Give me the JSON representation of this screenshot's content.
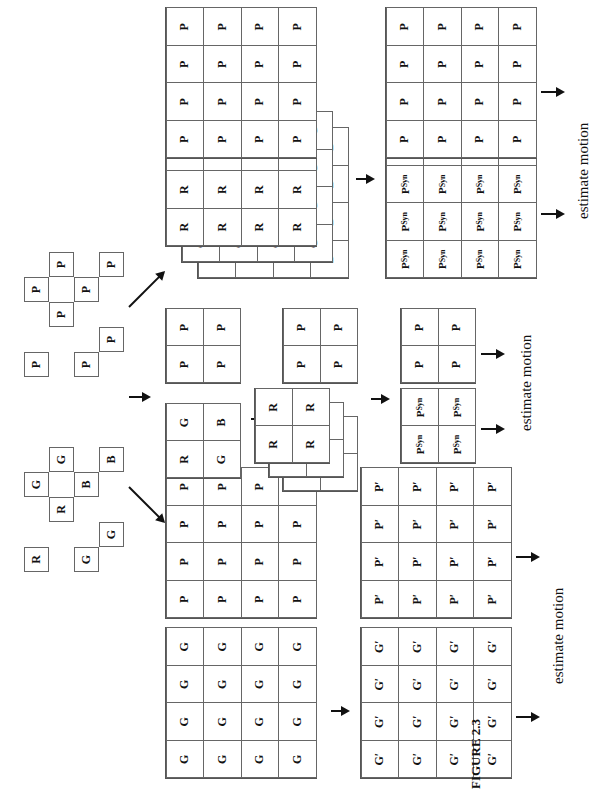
{
  "figure": {
    "caption": "FIGURE 2.3",
    "orientation": "rotated 90° counter-clockwise on page",
    "input_pattern": {
      "rgb_mosaic": [
        "R",
        "G",
        "R",
        "G",
        "G",
        "B",
        "G",
        "B"
      ],
      "panchromatic_mosaic": [
        "P",
        "P",
        "P",
        "P",
        "P",
        "P",
        "P",
        "P"
      ]
    },
    "branches": [
      {
        "name": "full-resolution synthesis",
        "arrow_label": "",
        "color_stack_layers": [
          "B",
          "G",
          "R"
        ],
        "pan_grid": "P",
        "synthesized_grid": "P",
        "synthesized_superscript": "Syn",
        "output_label": "estimate motion",
        "grid_size": "4x4"
      },
      {
        "name": "subsampled synthesis",
        "bayer_block": [
          [
            "R",
            "G"
          ],
          [
            "G",
            "B"
          ]
        ],
        "pan_block": [
          [
            "P",
            "P"
          ],
          [
            "P",
            "P"
          ]
        ],
        "stack_layers": [
          "B",
          "G",
          "R"
        ],
        "synthesized_grid": "P",
        "synthesized_superscript": "Syn",
        "output_label": "estimate motion",
        "grid_size": "2x2"
      },
      {
        "name": "green-channel interpolation",
        "green_grid": "G",
        "pan_grid": "P",
        "green_prime": "G′",
        "pan_prime": "P′",
        "output_label": "estimate motion",
        "grid_size": "4x4"
      }
    ]
  }
}
